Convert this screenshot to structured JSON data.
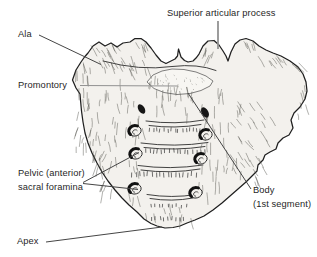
{
  "labels": {
    "superior_articular_process": "Superior articular process",
    "ala": "Ala",
    "promontory": "Promontory",
    "pelvic_foramina": "Pelvic (anterior)\nsacral foramina",
    "body": "Body\n(1st segment)",
    "apex": "Apex"
  },
  "colors": {
    "background": "#ffffff",
    "bone_fill": "#f3f1ed",
    "promontory_fill": "#f7f6f2",
    "bone_outline": "#1f1f1f",
    "leader_dark": "#454545",
    "leader_gray": "#929292",
    "label_text": "#1f1f1f"
  }
}
